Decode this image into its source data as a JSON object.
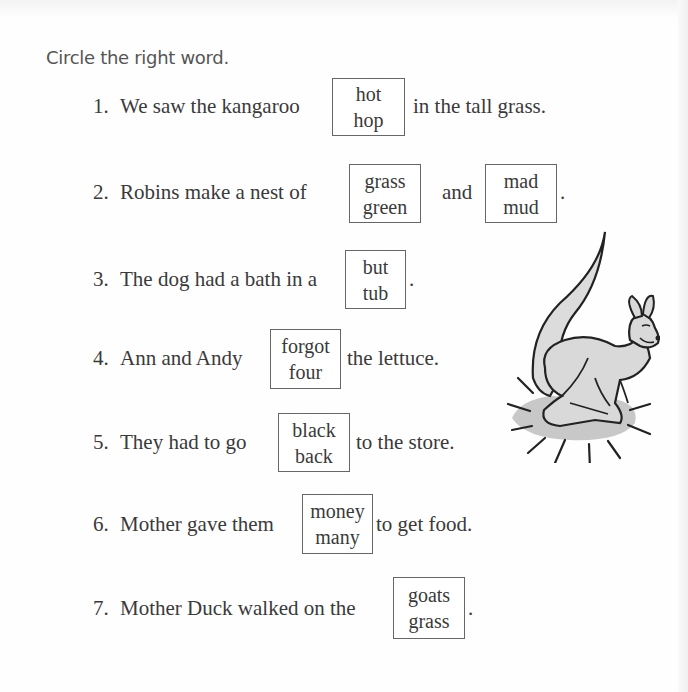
{
  "title": "Circle the right word.",
  "items": [
    {
      "number": "1.",
      "before": "We saw the kangaroo",
      "choices": [
        [
          "hot",
          "hop"
        ]
      ],
      "middle": "",
      "after": "in the tall grass."
    },
    {
      "number": "2.",
      "before": "Robins make a nest of",
      "choices": [
        [
          "grass",
          "green"
        ],
        [
          "mad",
          "mud"
        ]
      ],
      "middle": "and",
      "after": "."
    },
    {
      "number": "3.",
      "before": "The dog had a bath in a",
      "choices": [
        [
          "but",
          "tub"
        ]
      ],
      "middle": "",
      "after": "."
    },
    {
      "number": "4.",
      "before": "Ann and Andy",
      "choices": [
        [
          "forgot",
          "four"
        ]
      ],
      "middle": "",
      "after": "the lettuce."
    },
    {
      "number": "5.",
      "before": "They had to go",
      "choices": [
        [
          "black",
          "back"
        ]
      ],
      "middle": "",
      "after": "to the store."
    },
    {
      "number": "6.",
      "before": "Mother gave them",
      "choices": [
        [
          "money",
          "many"
        ]
      ],
      "middle": "",
      "after": "to get food."
    },
    {
      "number": "7.",
      "before": "Mother Duck walked on the",
      "choices": [
        [
          "goats",
          "grass"
        ]
      ],
      "middle": "",
      "after": "."
    }
  ],
  "illustration": {
    "icon": "kangaroo-illustration",
    "fill_color": "#d9d9d9",
    "shadow_color": "#c8c8c8",
    "outline_color": "#222222"
  }
}
